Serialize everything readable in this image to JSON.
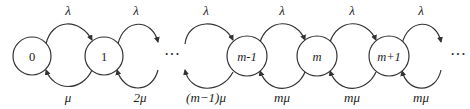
{
  "diagram": {
    "type": "birth-death state transition diagram",
    "states": [
      {
        "id": "s0",
        "label": "0",
        "cx": 32
      },
      {
        "id": "s1",
        "label": "1",
        "cx": 104
      },
      {
        "id": "sm1",
        "label": "m-1",
        "cx": 247
      },
      {
        "id": "sm",
        "label": "m",
        "cx": 317
      },
      {
        "id": "smp1",
        "label": "m+1",
        "cx": 389
      }
    ],
    "ellipses": [
      {
        "id": "dots-1",
        "text": "···",
        "x": 172
      },
      {
        "id": "dots-2",
        "text": "···",
        "x": 458
      }
    ],
    "forward_rates": [
      {
        "label": "λ",
        "x": 68
      },
      {
        "label": "λ",
        "x": 136
      },
      {
        "label": "λ",
        "x": 206
      },
      {
        "label": "λ",
        "x": 282
      },
      {
        "label": "λ",
        "x": 352
      },
      {
        "label": "λ",
        "x": 421
      }
    ],
    "backward_rates": [
      {
        "label": "μ",
        "x": 68
      },
      {
        "label": "2μ",
        "x": 140
      },
      {
        "label": "(m−1)μ",
        "x": 206
      },
      {
        "label": "mμ",
        "x": 282
      },
      {
        "label": "mμ",
        "x": 352
      },
      {
        "label": "mμ",
        "x": 421
      }
    ]
  }
}
